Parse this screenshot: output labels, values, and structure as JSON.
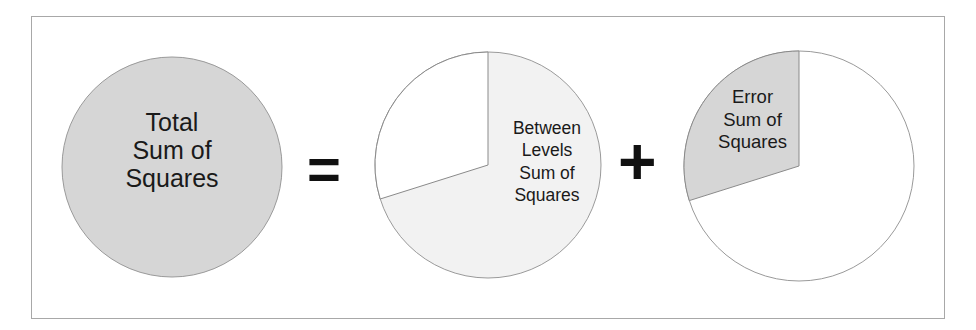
{
  "diagram": {
    "type": "venn-like pie equation",
    "total": {
      "label_lines": [
        "Total",
        "Sum of",
        "Squares"
      ],
      "fill": "#d6d6d6"
    },
    "equals_sign": "=",
    "between": {
      "label_lines": [
        "Between",
        "Levels",
        "Sum of",
        "Squares"
      ],
      "fill": "#f0f0f0",
      "share_pct": 70
    },
    "plus_sign": "+",
    "error": {
      "label_lines": [
        "Error",
        "Sum of",
        "Squares"
      ],
      "fill": "#d6d6d6",
      "share_pct": 30
    },
    "colors": {
      "border": "#a8a8a8",
      "shaded": "#d6d6d6",
      "light": "#f0f0f0",
      "white": "#ffffff",
      "text": "#1a1a1a"
    }
  },
  "labels": {
    "total": "Total\nSum of\nSquares",
    "between": "Between\nLevels\nSum of\nSquares",
    "error": "Error\nSum of\nSquares",
    "equals": "=",
    "plus": "+"
  }
}
